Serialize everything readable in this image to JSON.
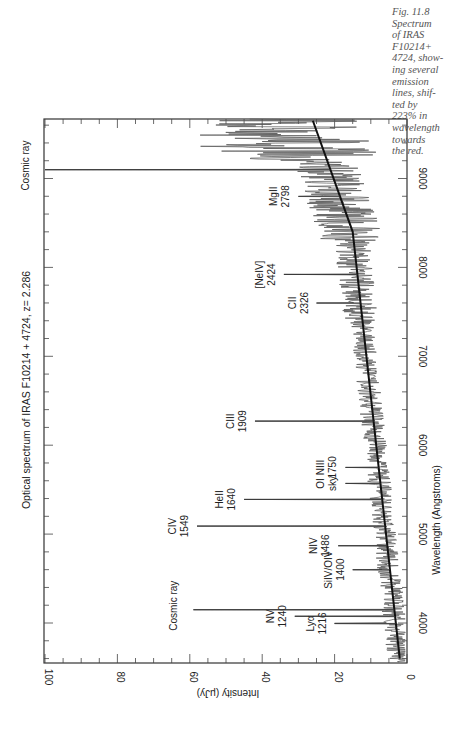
{
  "caption": {
    "lines": [
      "Fig. 11.8",
      "Spectrum",
      "of IRAS",
      "F10214+",
      "4724, show-",
      "ing several",
      "emission",
      "lines, shif-",
      "ted by",
      "223% in",
      "wavelength",
      "towards",
      "the red."
    ]
  },
  "chart_data": {
    "type": "line",
    "title": "Optical spectrum of IRAS F10214 + 4724, z= 2.286",
    "xlabel": "Wavelength (Angstroms)",
    "ylabel": "Intensity (μJy)",
    "xlim": [
      3550,
      9680
    ],
    "ylim": [
      0,
      100
    ],
    "x_ticks": [
      4000,
      5000,
      6000,
      7000,
      8000,
      9000
    ],
    "y_ticks": [
      0,
      20,
      40,
      60,
      80,
      100
    ],
    "orientation": "rotated 90° (wavelength axis vertical, increasing upward; intensity axis horizontal, increasing leftward)",
    "grid": false,
    "series": [
      {
        "name": "continuum fit",
        "x": [
          3600,
          8400,
          9650
        ],
        "y": [
          2,
          15,
          26
        ]
      }
    ],
    "lines": [
      {
        "label": "Lyα",
        "rest": "1216",
        "wavelength": 3995,
        "intensity": 20
      },
      {
        "label": "NV",
        "rest": "1240",
        "wavelength": 4075,
        "intensity": 31
      },
      {
        "label": "Cosmic ray",
        "rest": "",
        "wavelength": 4150,
        "intensity": 59
      },
      {
        "label": "SiIV/OIV",
        "rest": "1400",
        "wavelength": 4600,
        "intensity": 15
      },
      {
        "label": "NIV",
        "rest": "1486",
        "wavelength": 4870,
        "intensity": 19
      },
      {
        "label": "CIV",
        "rest": "1549",
        "wavelength": 5090,
        "intensity": 58
      },
      {
        "label": "HeII",
        "rest": "1640",
        "wavelength": 5390,
        "intensity": 45
      },
      {
        "label": "OI",
        "rest": "sky",
        "wavelength": 5570,
        "intensity": 17
      },
      {
        "label": "NIII",
        "rest": "1750",
        "wavelength": 5750,
        "intensity": 17
      },
      {
        "label": "CIII",
        "rest": "1909",
        "wavelength": 6270,
        "intensity": 42
      },
      {
        "label": "CII",
        "rest": "2326",
        "wavelength": 7600,
        "intensity": 25
      },
      {
        "label": "[NeIV]",
        "rest": "2424",
        "wavelength": 7920,
        "intensity": 34
      },
      {
        "label": "MgII",
        "rest": "2798",
        "wavelength": 8800,
        "intensity": 30
      },
      {
        "label": "Cosmic ray",
        "rest": "",
        "wavelength": 9100,
        "intensity": 100
      }
    ]
  }
}
